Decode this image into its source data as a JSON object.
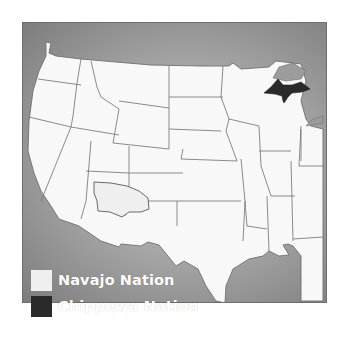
{
  "map": {
    "title": "",
    "colors": {
      "background_outer": "#7d7d7d",
      "background_inner": "#d2d2d2",
      "land": "#f8f8f8",
      "border": "#6f6f6f",
      "navajo": "#efefef",
      "chippewa": "#2a2a2a"
    },
    "highlighted_regions": [
      {
        "name": "Navajo Nation",
        "location": "Four Corners (Arizona / New Mexico / Utah)"
      },
      {
        "name": "Chippewa Nation",
        "location": "Upper Peninsula of Michigan"
      }
    ]
  },
  "legend": {
    "items": [
      {
        "label": "Navajo Nation",
        "color": "#efefef"
      },
      {
        "label": "Chippewa Nation",
        "color": "#2a2a2a"
      }
    ]
  },
  "shapes": {
    "land": "M 45 41 L 50 42 L 48 52 L 55 55 L 80 58 L 150 64 L 200 65 L 228 65 L 232 62 L 240 68 L 268 66 L 275 60 L 300 63 L 305 80 L 300 100 L 305 118 L 310 125 L 322 128 L 322 300 L 300 300 L 300 255 L 292 245 L 287 243 L 282 244 L 288 254 L 278 255 L 268 250 L 262 255 L 248 258 L 232 268 L 225 285 L 224 302 L 215 300 L 205 285 L 197 268 L 183 260 L 175 265 L 158 244 L 147 241 L 140 245 L 120 243 L 118 246 L 100 240 L 78 225 L 58 218 L 50 205 L 40 190 L 33 172 L 27 150 L 28 120 L 32 90 L 38 70 L 45 55 Z",
    "state_lines": [
      "M 37 78 L 80 84",
      "M 28 116 L 70 126",
      "M 80 58 L 76 82 L 72 115 L 70 126",
      "M 90 60 L 96 86 L 100 96 L 118 108",
      "M 70 126 L 40 200",
      "M 70 126 L 118 134",
      "M 118 108 L 112 142",
      "M 118 100 L 168 107",
      "M 112 142 L 168 148",
      "M 168 65 L 168 148",
      "M 168 96 L 222 96",
      "M 168 128 L 220 130",
      "M 222 65 L 220 96 L 228 118 L 225 130",
      "M 225 130 L 236 160",
      "M 236 160 L 180 158",
      "M 182 148 L 180 158",
      "M 90 140 L 85 200 L 80 218",
      "M 85 170 L 128 172",
      "M 128 145 L 128 200",
      "M 128 172 L 182 172",
      "M 124 200 L 176 200 L 176 225",
      "M 176 200 L 240 200",
      "M 240 158 L 244 200 L 246 225",
      "M 228 118 L 258 125",
      "M 258 125 L 260 165 L 270 195",
      "M 246 225 L 266 228",
      "M 266 195 L 268 250",
      "M 270 195 L 294 195",
      "M 290 160 L 292 240",
      "M 258 150 L 290 150",
      "M 300 125 L 298 165",
      "M 292 238 L 322 236",
      "M 298 165 L 322 165",
      "M 300 128 L 300 160",
      "M 95 196 L 125 200",
      "M 125 200 L 124 215",
      "M 244 200 L 242 240"
    ],
    "navajo": "M 93 181 L 110 182 L 126 185 L 138 190 L 147 197 L 148 208 L 140 211 L 128 211 L 121 216 L 109 211 L 97 210 L 96 200 L 93 192 Z",
    "chippewa": "M 263 92 L 270 86 L 277 78 L 282 84 L 291 84 L 300 81 L 309 88 L 301 91 L 291 92 L 287 96 L 283 102 L 282 100 L 281 95 L 274 93 Z",
    "lakes": [
      "M 278 66 L 292 62 L 305 70 L 300 78 L 285 80 L 272 77 Z",
      "M 322 115 L 312 118 L 305 125 L 322 122 Z"
    ]
  }
}
